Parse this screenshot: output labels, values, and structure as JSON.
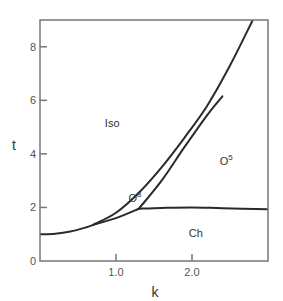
{
  "chart_data": {
    "type": "line",
    "title": "",
    "xlabel": "k",
    "ylabel": "t",
    "xlim": [
      0,
      3.0
    ],
    "ylim": [
      0,
      9.0
    ],
    "grid": false,
    "legend": null,
    "x_ticks": [
      {
        "value": 1.0,
        "label": "1.0"
      },
      {
        "value": 2.0,
        "label": "2.0"
      }
    ],
    "y_ticks": [
      {
        "value": 0,
        "label": "0"
      },
      {
        "value": 2,
        "label": "2"
      },
      {
        "value": 4,
        "label": "4"
      },
      {
        "value": 6,
        "label": "6"
      },
      {
        "value": 8,
        "label": "8"
      }
    ],
    "series": [
      {
        "name": "Iso-ordered boundary (common)",
        "x": [
          0.0,
          0.2,
          0.4,
          0.6,
          0.7
        ],
        "y": [
          1.0,
          1.02,
          1.1,
          1.25,
          1.35
        ]
      },
      {
        "name": "Iso / O8 boundary (upper branch)",
        "x": [
          0.7,
          1.0,
          1.3,
          1.6,
          1.9,
          2.2,
          2.5,
          2.8
        ],
        "y": [
          1.35,
          1.8,
          2.55,
          3.5,
          4.6,
          5.8,
          7.3,
          9.0
        ]
      },
      {
        "name": "O8 / Ch boundary",
        "x": [
          0.7,
          1.0,
          1.3
        ],
        "y": [
          1.35,
          1.6,
          1.95
        ]
      },
      {
        "name": "O8 / O5 boundary",
        "x": [
          1.3,
          1.6,
          1.9,
          2.2,
          2.4
        ],
        "y": [
          1.95,
          3.0,
          4.25,
          5.45,
          6.15
        ]
      },
      {
        "name": "O5 / Ch boundary",
        "x": [
          1.3,
          1.6,
          2.0,
          2.4,
          3.0
        ],
        "y": [
          1.95,
          1.98,
          2.0,
          1.97,
          1.93
        ]
      }
    ],
    "annotations": [
      {
        "text": "Iso",
        "x": 0.95,
        "y": 5.0
      },
      {
        "text": "O",
        "sup": "8",
        "x": 1.25,
        "y": 2.2
      },
      {
        "text": "O",
        "sup": "5",
        "x": 2.45,
        "y": 3.6
      },
      {
        "text": "Ch",
        "x": 2.05,
        "y": 0.9
      }
    ]
  },
  "colors": {
    "axis": "#777777",
    "curve": "#2a2a2a",
    "text": "#333333",
    "background": "#ffffff"
  }
}
